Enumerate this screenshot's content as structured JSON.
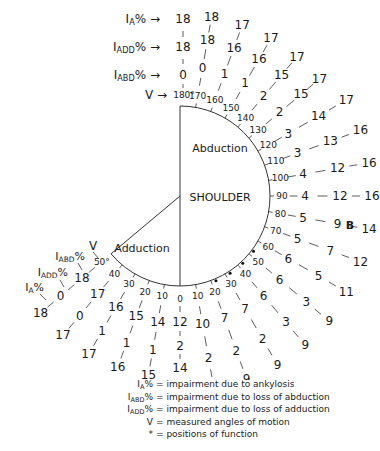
{
  "diagram": {
    "title": "SHOULDER",
    "figure_label": "B",
    "abduction_label": "Abduction",
    "adduction_label": "Adduction",
    "header_labels": {
      "ia": "I",
      "ia_sub": "A",
      "ia_suffix": "% →",
      "iadd": "I",
      "iadd_sub": "ADD",
      "iadd_suffix": "% →",
      "iabd": "I",
      "iabd_sub": "ABD",
      "iabd_suffix": "% →",
      "v": "V →"
    },
    "adduction_header_labels": {
      "v": "V",
      "iabd": "I",
      "iabd_sub": "ABD",
      "iabd_suffix": "%",
      "iadd": "I",
      "iadd_sub": "ADD",
      "iadd_suffix": "%",
      "ia": "I",
      "ia_sub": "A",
      "ia_suffix": "%"
    },
    "abduction": [
      {
        "angle": "180°",
        "iabd": "0",
        "iadd": "18",
        "ia": "18",
        "function_position": false
      },
      {
        "angle": "170",
        "iabd": "0",
        "iadd": "18",
        "ia": "18",
        "function_position": false
      },
      {
        "angle": "160",
        "iabd": "1",
        "iadd": "16",
        "ia": "17",
        "function_position": false
      },
      {
        "angle": "150",
        "iabd": "1",
        "iadd": "16",
        "ia": "17",
        "function_position": false
      },
      {
        "angle": "140",
        "iabd": "2",
        "iadd": "15",
        "ia": "17",
        "function_position": false
      },
      {
        "angle": "130",
        "iabd": "2",
        "iadd": "15",
        "ia": "17",
        "function_position": false
      },
      {
        "angle": "120",
        "iabd": "3",
        "iadd": "14",
        "ia": "17",
        "function_position": false
      },
      {
        "angle": "110",
        "iabd": "3",
        "iadd": "13",
        "ia": "16",
        "function_position": false
      },
      {
        "angle": "100",
        "iabd": "4",
        "iadd": "12",
        "ia": "16",
        "function_position": false
      },
      {
        "angle": "90",
        "iabd": "4",
        "iadd": "12",
        "ia": "16",
        "function_position": false
      },
      {
        "angle": "80",
        "iabd": "5",
        "iadd": "9",
        "ia": "14",
        "function_position": false
      },
      {
        "angle": "70",
        "iabd": "5",
        "iadd": "7",
        "ia": "12",
        "function_position": false
      },
      {
        "angle": "60",
        "iabd": "6",
        "iadd": "5",
        "ia": "11",
        "function_position": false
      },
      {
        "angle": "50",
        "iabd": "6",
        "iadd": "3",
        "ia": "9",
        "function_position": true
      },
      {
        "angle": "40",
        "iabd": "6",
        "iadd": "3",
        "ia": "9",
        "function_position": true
      },
      {
        "angle": "30",
        "iabd": "7",
        "iadd": "2",
        "ia": "9",
        "function_position": true
      },
      {
        "angle": "20",
        "iabd": "7",
        "iadd": "2",
        "ia": "9",
        "function_position": true
      },
      {
        "angle": "10",
        "iabd": "10",
        "iadd": "2",
        "ia": "12",
        "function_position": false
      },
      {
        "angle": "0",
        "iabd": "12",
        "iadd": "2",
        "ia": "14",
        "function_position": false
      }
    ],
    "adduction": [
      {
        "angle": "10",
        "iabd": "14",
        "iadd": "1",
        "ia": "15"
      },
      {
        "angle": "20",
        "iabd": "15",
        "iadd": "1",
        "ia": "16"
      },
      {
        "angle": "30",
        "iabd": "16",
        "iadd": "1",
        "ia": "17"
      },
      {
        "angle": "40",
        "iabd": "17",
        "iadd": "0",
        "ia": "17"
      },
      {
        "angle": "50°",
        "iabd": "18",
        "iadd": "0",
        "ia": "18"
      }
    ]
  },
  "legend": {
    "items": [
      {
        "sym": "I",
        "sub": "A",
        "suffix": "%",
        "text": "= impairment due to ankylosis"
      },
      {
        "sym": "I",
        "sub": "ABD",
        "suffix": "%",
        "text": "= impairment due to loss of abduction"
      },
      {
        "sym": "I",
        "sub": "ADD",
        "suffix": "%",
        "text": "= impairment due to loss of adduction"
      },
      {
        "sym": "V",
        "sub": "",
        "suffix": "",
        "text": "= measured angles of motion"
      },
      {
        "sym": "*",
        "sub": "",
        "suffix": "",
        "text": "= positions of function"
      }
    ]
  }
}
